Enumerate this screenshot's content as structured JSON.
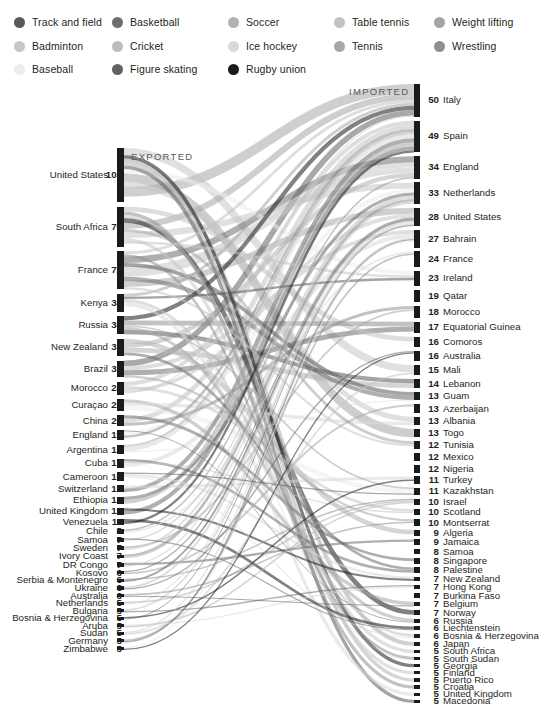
{
  "meta": {
    "bg_color": "#ffffff",
    "text_color": "#231f20",
    "node_color": "#1a1a1a"
  },
  "legend": {
    "items": [
      {
        "label": "Track and field",
        "color": "#595959",
        "col": 0,
        "row": 0
      },
      {
        "label": "Badminton",
        "color": "#c7c7c7",
        "col": 0,
        "row": 1
      },
      {
        "label": "Baseball",
        "color": "#ececec",
        "col": 0,
        "row": 2
      },
      {
        "label": "Basketball",
        "color": "#6e6e6e",
        "col": 1,
        "row": 0
      },
      {
        "label": "Cricket",
        "color": "#bdbdbd",
        "col": 1,
        "row": 1
      },
      {
        "label": "Figure skating",
        "color": "#626262",
        "col": 1,
        "row": 2
      },
      {
        "label": "Soccer",
        "color": "#b2b2b2",
        "col": 2,
        "row": 0
      },
      {
        "label": "Ice hockey",
        "color": "#d9d9d9",
        "col": 2,
        "row": 1
      },
      {
        "label": "Rugby union",
        "color": "#1a1a1a",
        "col": 2,
        "row": 2
      },
      {
        "label": "Table tennis",
        "color": "#c2c2c2",
        "col": 3,
        "row": 0
      },
      {
        "label": "Tennis",
        "color": "#a8a8a8",
        "col": 3,
        "row": 1
      },
      {
        "label": "Weight lifting",
        "color": "#a5a5a5",
        "col": 4,
        "row": 0
      },
      {
        "label": "Wrestling",
        "color": "#8f8f8f",
        "col": 4,
        "row": 1
      }
    ]
  },
  "axis_labels": {
    "exported": "EXPORTED",
    "imported": "IMPORTED"
  },
  "chart_data": {
    "type": "sankey",
    "legend_position": "top",
    "value_unit": "players",
    "exported": {
      "label": "EXPORTED",
      "nodes": [
        {
          "name": "United States",
          "value": 103
        },
        {
          "name": "South Africa",
          "value": 76
        },
        {
          "name": "France",
          "value": 72
        },
        {
          "name": "Kenya",
          "value": 34
        },
        {
          "name": "Russia",
          "value": 34
        },
        {
          "name": "New Zealand",
          "value": 33
        },
        {
          "name": "Brazil",
          "value": 32
        },
        {
          "name": "Morocco",
          "value": 24
        },
        {
          "name": "Curaçao",
          "value": 22
        },
        {
          "name": "China",
          "value": 20
        },
        {
          "name": "England",
          "value": 19
        },
        {
          "name": "Argentina",
          "value": 18
        },
        {
          "name": "Cuba",
          "value": 17
        },
        {
          "name": "Cameroon",
          "value": 16
        },
        {
          "name": "Switzerland",
          "value": 13
        },
        {
          "name": "Ethiopia",
          "value": 13
        },
        {
          "name": "United Kingdom",
          "value": 12
        },
        {
          "name": "Venezuela",
          "value": 11
        },
        {
          "name": "Chile",
          "value": 8
        },
        {
          "name": "Samoa",
          "value": 7
        },
        {
          "name": "Sweden",
          "value": 7
        },
        {
          "name": "Ivory Coast",
          "value": 7
        },
        {
          "name": "DR Congo",
          "value": 7
        },
        {
          "name": "Kosovo",
          "value": 6
        },
        {
          "name": "Serbia & Montenegro",
          "value": 6
        },
        {
          "name": "Ukraine",
          "value": 6
        },
        {
          "name": "Australia",
          "value": 6
        },
        {
          "name": "Netherlands",
          "value": 5
        },
        {
          "name": "Bulgaria",
          "value": 5
        },
        {
          "name": "Bosnia & Herzegovina",
          "value": 5
        },
        {
          "name": "Aruba",
          "value": 5
        },
        {
          "name": "Sudan",
          "value": 5
        },
        {
          "name": "Germany",
          "value": 5
        },
        {
          "name": "Zimbabwe",
          "value": 5
        }
      ]
    },
    "imported": {
      "label": "IMPORTED",
      "nodes": [
        {
          "name": "Italy",
          "value": 50
        },
        {
          "name": "Spain",
          "value": 49
        },
        {
          "name": "England",
          "value": 34
        },
        {
          "name": "Netherlands",
          "value": 33
        },
        {
          "name": "United States",
          "value": 28
        },
        {
          "name": "Bahrain",
          "value": 27
        },
        {
          "name": "France",
          "value": 24
        },
        {
          "name": "Ireland",
          "value": 23
        },
        {
          "name": "Qatar",
          "value": 19
        },
        {
          "name": "Morocco",
          "value": 18
        },
        {
          "name": "Equatorial Guinea",
          "value": 17
        },
        {
          "name": "Comoros",
          "value": 16
        },
        {
          "name": "Australia",
          "value": 16
        },
        {
          "name": "Mali",
          "value": 15
        },
        {
          "name": "Lebanon",
          "value": 14
        },
        {
          "name": "Guam",
          "value": 13
        },
        {
          "name": "Azerbaijan",
          "value": 13
        },
        {
          "name": "Albania",
          "value": 13
        },
        {
          "name": "Togo",
          "value": 13
        },
        {
          "name": "Tunisia",
          "value": 12
        },
        {
          "name": "Mexico",
          "value": 12
        },
        {
          "name": "Nigeria",
          "value": 12
        },
        {
          "name": "Turkey",
          "value": 11
        },
        {
          "name": "Kazakhstan",
          "value": 11
        },
        {
          "name": "Israel",
          "value": 10
        },
        {
          "name": "Scotland",
          "value": 10
        },
        {
          "name": "Montserrat",
          "value": 10
        },
        {
          "name": "Algeria",
          "value": 9
        },
        {
          "name": "Jamaica",
          "value": 9
        },
        {
          "name": "Samoa",
          "value": 8
        },
        {
          "name": "Singapore",
          "value": 8
        },
        {
          "name": "Palestine",
          "value": 8
        },
        {
          "name": "New Zealand",
          "value": 7
        },
        {
          "name": "Hong Kong",
          "value": 7
        },
        {
          "name": "Burkina Faso",
          "value": 7
        },
        {
          "name": "Belgium",
          "value": 7
        },
        {
          "name": "Norway",
          "value": 7
        },
        {
          "name": "Russia",
          "value": 6
        },
        {
          "name": "Liechtenstein",
          "value": 6
        },
        {
          "name": "Bosnia & Herzegovina",
          "value": 6
        },
        {
          "name": "Japan",
          "value": 6
        },
        {
          "name": "South Africa",
          "value": 5
        },
        {
          "name": "South Sudan",
          "value": 5
        },
        {
          "name": "Georgia",
          "value": 5
        },
        {
          "name": "Finland",
          "value": 5
        },
        {
          "name": "Puerto Rico",
          "value": 5
        },
        {
          "name": "Croatia",
          "value": 5
        },
        {
          "name": "United Kingdom",
          "value": 5
        },
        {
          "name": "Macedonia",
          "value": 5
        }
      ]
    }
  }
}
